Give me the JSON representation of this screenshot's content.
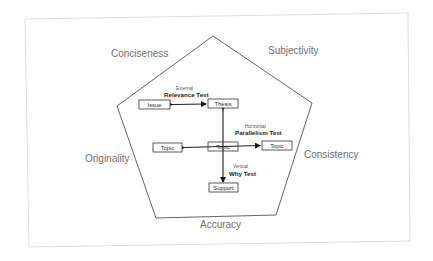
{
  "diagram": {
    "frame": {
      "stroke": "#d4d4d4"
    },
    "pentagon": {
      "stroke": "#555555",
      "vertices": [
        [
          213,
          36
        ],
        [
          312,
          103
        ],
        [
          276,
          215
        ],
        [
          156,
          218
        ],
        [
          117,
          106
        ]
      ]
    },
    "qualities": {
      "top_left": "Conciseness",
      "top_right": "Subjectivity",
      "left": "Originality",
      "right": "Consistency",
      "bottom": "Accuracy"
    },
    "tests": {
      "external": {
        "qualifier": "External",
        "name": "Relevance Test"
      },
      "horizontal": {
        "qualifier": "Horizontal",
        "name": "Parallelism Test"
      },
      "vertical": {
        "qualifier": "Vertical",
        "name": "Why Test"
      }
    },
    "boxes": {
      "issue": "Issue",
      "thesis": "Thesis",
      "topic_left": "Topic",
      "topic_center": "Topic",
      "topic_right": "Topic",
      "support": "Support"
    },
    "colors": {
      "quality_text": "#6f6f6f",
      "line": "#1a1a1a",
      "box_border": "#333333"
    }
  }
}
